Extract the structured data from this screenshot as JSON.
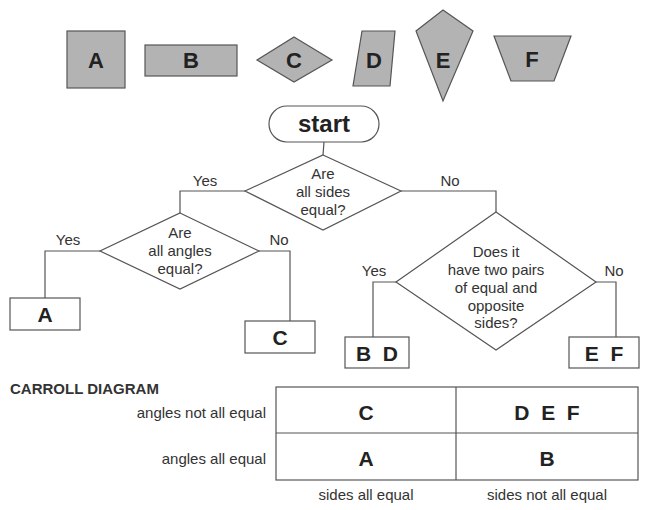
{
  "shapes": [
    {
      "id": "A",
      "label": "A",
      "type": "square"
    },
    {
      "id": "B",
      "label": "B",
      "type": "rectangle"
    },
    {
      "id": "C",
      "label": "C",
      "type": "rhombus"
    },
    {
      "id": "D",
      "label": "D",
      "type": "parallelogram"
    },
    {
      "id": "E",
      "label": "E",
      "type": "kite"
    },
    {
      "id": "F",
      "label": "F",
      "type": "trapezium"
    }
  ],
  "flowchart": {
    "start": "start",
    "q1": {
      "lines": [
        "Are",
        "all sides",
        "equal?"
      ],
      "yes": "Yes",
      "no": "No"
    },
    "q2": {
      "lines": [
        "Are",
        "all angles",
        "equal?"
      ],
      "yes": "Yes",
      "no": "No"
    },
    "q3": {
      "lines": [
        "Does it",
        "have two pairs",
        "of equal and",
        "opposite",
        "sides?"
      ],
      "yes": "Yes",
      "no": "No"
    },
    "outcomes": {
      "q2_yes": "A",
      "q2_no": "C",
      "q3_yes": "B  D",
      "q3_no": "E  F"
    }
  },
  "carroll": {
    "title": "CARROLL DIAGRAM",
    "row_labels": [
      "angles not all equal",
      "angles all equal"
    ],
    "col_labels": [
      "sides all equal",
      "sides not all equal"
    ],
    "cells": [
      [
        "C",
        "D  E  F"
      ],
      [
        "A",
        "B"
      ]
    ]
  },
  "colors": {
    "shape_fill": "#b3b3b3",
    "stroke": "#555555",
    "text": "#222222"
  }
}
